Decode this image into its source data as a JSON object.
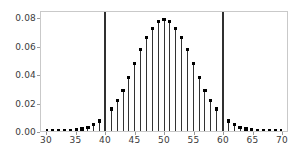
{
  "chart_data": {
    "type": "bar",
    "title": "",
    "subtitle": "",
    "xlabel": "",
    "ylabel": "",
    "xlim": [
      30,
      70
    ],
    "ylim": [
      0.0,
      0.085
    ],
    "grid": false,
    "legend": null,
    "marker": "filled-square-dot",
    "stem_color": "#303030",
    "marker_color": "#000000",
    "frame_color": "#c9c9c9",
    "background": "#ffffff",
    "x_ticks": [
      30,
      35,
      40,
      45,
      50,
      55,
      60,
      65,
      70
    ],
    "x_tick_labels": [
      "30",
      "35",
      "40",
      "45",
      "50",
      "55",
      "60",
      "65",
      "70"
    ],
    "y_ticks": [
      0.0,
      0.02,
      0.04,
      0.06,
      0.08
    ],
    "y_tick_labels": [
      "0.00",
      "0.02",
      "0.04",
      "0.06",
      "0.08"
    ],
    "x": [
      30,
      31,
      32,
      33,
      34,
      35,
      36,
      37,
      38,
      39,
      40,
      41,
      42,
      43,
      44,
      45,
      46,
      47,
      48,
      49,
      50,
      51,
      52,
      53,
      54,
      55,
      56,
      57,
      58,
      59,
      60,
      61,
      62,
      63,
      64,
      65,
      66,
      67,
      68,
      69,
      70
    ],
    "values": [
      0.0,
      0.0,
      0.0001,
      0.0001,
      0.0003,
      0.0007,
      0.0014,
      0.0027,
      0.0045,
      0.0071,
      0.0108,
      0.0157,
      0.0217,
      0.029,
      0.0381,
      0.048,
      0.058,
      0.0666,
      0.0735,
      0.078,
      0.0796,
      0.078,
      0.0735,
      0.0666,
      0.058,
      0.048,
      0.0381,
      0.029,
      0.0217,
      0.0157,
      0.0108,
      0.0071,
      0.0045,
      0.0027,
      0.0014,
      0.0007,
      0.0003,
      0.0001,
      0.0001,
      0.0,
      0.0
    ],
    "reference_lines": [
      {
        "x": 40,
        "color": "#303030",
        "width": 2,
        "full_height": true
      },
      {
        "x": 60,
        "color": "#303030",
        "width": 2,
        "full_height": true
      }
    ]
  }
}
